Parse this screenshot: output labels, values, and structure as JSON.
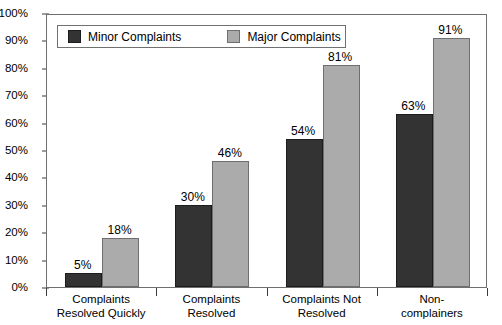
{
  "chart_data": {
    "type": "bar",
    "title": "",
    "xlabel": "",
    "ylabel": "",
    "ylim": [
      0,
      100
    ],
    "grid": false,
    "legend_position": "top-left-inside",
    "value_suffix": "%",
    "categories": [
      "Complaints\nResolved Quickly",
      "Complaints\nResolved",
      "Complaints Not\nResolved",
      "Non-complainers"
    ],
    "y_ticks": [
      "0%",
      "10%",
      "20%",
      "30%",
      "40%",
      "50%",
      "60%",
      "70%",
      "80%",
      "90%",
      "100%"
    ],
    "y_tick_values": [
      0,
      10,
      20,
      30,
      40,
      50,
      60,
      70,
      80,
      90,
      100
    ],
    "series": [
      {
        "name": "Minor Complaints",
        "color": "#333333",
        "values": [
          5,
          30,
          54,
          63
        ],
        "labels": [
          "5%",
          "30%",
          "54%",
          "63%"
        ]
      },
      {
        "name": "Major Complaints",
        "color": "#ababab",
        "values": [
          18,
          46,
          81,
          91
        ],
        "labels": [
          "18%",
          "46%",
          "81%",
          "91%"
        ]
      }
    ]
  },
  "legend": {
    "items": [
      {
        "label": "Minor Complaints",
        "swatch": "minor"
      },
      {
        "label": "Major Complaints",
        "swatch": "major"
      }
    ]
  }
}
